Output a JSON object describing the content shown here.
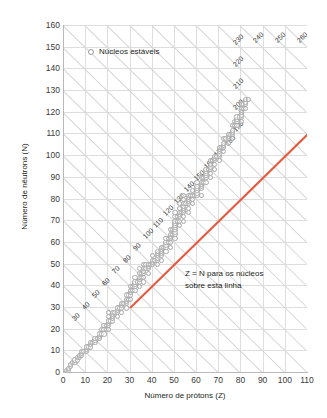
{
  "chart_data": {
    "type": "scatter",
    "title": "",
    "xlabel": "Número de prótons (Z)",
    "ylabel": "Número de nêutrons (N)",
    "xlim": [
      0,
      110
    ],
    "ylim": [
      0,
      160
    ],
    "xticks": [
      0,
      10,
      20,
      30,
      40,
      50,
      60,
      70,
      80,
      90,
      100,
      110
    ],
    "yticks": [
      0,
      10,
      20,
      30,
      40,
      50,
      60,
      70,
      80,
      90,
      100,
      110,
      120,
      130,
      140,
      150,
      160
    ],
    "xtick_step": 10,
    "ytick_step": 10,
    "grid": true,
    "legend_position": "top-left",
    "series": [
      {
        "name": "Núcleos estáveis",
        "type": "scatter",
        "marker": "open-circle",
        "color": "#a8a8a8",
        "points": [
          [
            1,
            0
          ],
          [
            1,
            1
          ],
          [
            2,
            1
          ],
          [
            2,
            2
          ],
          [
            3,
            3
          ],
          [
            3,
            4
          ],
          [
            4,
            5
          ],
          [
            5,
            5
          ],
          [
            5,
            6
          ],
          [
            6,
            6
          ],
          [
            6,
            7
          ],
          [
            7,
            7
          ],
          [
            7,
            8
          ],
          [
            8,
            8
          ],
          [
            8,
            9
          ],
          [
            8,
            10
          ],
          [
            9,
            10
          ],
          [
            10,
            10
          ],
          [
            10,
            11
          ],
          [
            10,
            12
          ],
          [
            11,
            12
          ],
          [
            12,
            12
          ],
          [
            12,
            13
          ],
          [
            12,
            14
          ],
          [
            13,
            14
          ],
          [
            14,
            14
          ],
          [
            14,
            15
          ],
          [
            14,
            16
          ],
          [
            15,
            16
          ],
          [
            16,
            16
          ],
          [
            16,
            17
          ],
          [
            16,
            18
          ],
          [
            17,
            18
          ],
          [
            17,
            20
          ],
          [
            18,
            18
          ],
          [
            18,
            20
          ],
          [
            18,
            22
          ],
          [
            19,
            20
          ],
          [
            19,
            22
          ],
          [
            20,
            20
          ],
          [
            20,
            22
          ],
          [
            20,
            23
          ],
          [
            20,
            24
          ],
          [
            20,
            26
          ],
          [
            20,
            28
          ],
          [
            21,
            24
          ],
          [
            22,
            24
          ],
          [
            22,
            25
          ],
          [
            22,
            26
          ],
          [
            22,
            27
          ],
          [
            22,
            28
          ],
          [
            23,
            28
          ],
          [
            24,
            26
          ],
          [
            24,
            28
          ],
          [
            24,
            29
          ],
          [
            24,
            30
          ],
          [
            25,
            30
          ],
          [
            26,
            28
          ],
          [
            26,
            30
          ],
          [
            26,
            31
          ],
          [
            26,
            32
          ],
          [
            27,
            32
          ],
          [
            28,
            30
          ],
          [
            28,
            32
          ],
          [
            28,
            33
          ],
          [
            28,
            34
          ],
          [
            28,
            36
          ],
          [
            29,
            34
          ],
          [
            29,
            36
          ],
          [
            30,
            34
          ],
          [
            30,
            36
          ],
          [
            30,
            37
          ],
          [
            30,
            38
          ],
          [
            30,
            40
          ],
          [
            31,
            38
          ],
          [
            31,
            40
          ],
          [
            32,
            38
          ],
          [
            32,
            40
          ],
          [
            32,
            41
          ],
          [
            32,
            42
          ],
          [
            32,
            44
          ],
          [
            33,
            42
          ],
          [
            34,
            40
          ],
          [
            34,
            42
          ],
          [
            34,
            43
          ],
          [
            34,
            44
          ],
          [
            34,
            46
          ],
          [
            34,
            48
          ],
          [
            35,
            44
          ],
          [
            35,
            46
          ],
          [
            36,
            42
          ],
          [
            36,
            44
          ],
          [
            36,
            46
          ],
          [
            36,
            47
          ],
          [
            36,
            48
          ],
          [
            36,
            50
          ],
          [
            37,
            48
          ],
          [
            37,
            50
          ],
          [
            38,
            46
          ],
          [
            38,
            48
          ],
          [
            38,
            49
          ],
          [
            38,
            50
          ],
          [
            39,
            50
          ],
          [
            40,
            50
          ],
          [
            40,
            51
          ],
          [
            40,
            52
          ],
          [
            40,
            54
          ],
          [
            41,
            52
          ],
          [
            42,
            50
          ],
          [
            42,
            52
          ],
          [
            42,
            53
          ],
          [
            42,
            54
          ],
          [
            42,
            55
          ],
          [
            42,
            56
          ],
          [
            44,
            52
          ],
          [
            44,
            54
          ],
          [
            44,
            55
          ],
          [
            44,
            56
          ],
          [
            44,
            57
          ],
          [
            44,
            58
          ],
          [
            45,
            58
          ],
          [
            46,
            56
          ],
          [
            46,
            58
          ],
          [
            46,
            59
          ],
          [
            46,
            60
          ],
          [
            46,
            62
          ],
          [
            47,
            60
          ],
          [
            47,
            62
          ],
          [
            48,
            58
          ],
          [
            48,
            60
          ],
          [
            48,
            62
          ],
          [
            48,
            63
          ],
          [
            48,
            64
          ],
          [
            48,
            66
          ],
          [
            49,
            64
          ],
          [
            49,
            66
          ],
          [
            50,
            62
          ],
          [
            50,
            64
          ],
          [
            50,
            65
          ],
          [
            50,
            66
          ],
          [
            50,
            67
          ],
          [
            50,
            68
          ],
          [
            50,
            69
          ],
          [
            50,
            70
          ],
          [
            50,
            72
          ],
          [
            50,
            74
          ],
          [
            51,
            70
          ],
          [
            51,
            72
          ],
          [
            52,
            68
          ],
          [
            52,
            70
          ],
          [
            52,
            72
          ],
          [
            52,
            73
          ],
          [
            52,
            74
          ],
          [
            52,
            76
          ],
          [
            52,
            78
          ],
          [
            53,
            74
          ],
          [
            54,
            70
          ],
          [
            54,
            72
          ],
          [
            54,
            74
          ],
          [
            54,
            75
          ],
          [
            54,
            76
          ],
          [
            54,
            77
          ],
          [
            54,
            78
          ],
          [
            54,
            80
          ],
          [
            54,
            82
          ],
          [
            55,
            78
          ],
          [
            56,
            74
          ],
          [
            56,
            76
          ],
          [
            56,
            78
          ],
          [
            56,
            79
          ],
          [
            56,
            80
          ],
          [
            56,
            81
          ],
          [
            56,
            82
          ],
          [
            57,
            82
          ],
          [
            58,
            78
          ],
          [
            58,
            80
          ],
          [
            58,
            82
          ],
          [
            58,
            84
          ],
          [
            59,
            82
          ],
          [
            60,
            82
          ],
          [
            60,
            83
          ],
          [
            60,
            84
          ],
          [
            60,
            85
          ],
          [
            60,
            86
          ],
          [
            60,
            88
          ],
          [
            62,
            82
          ],
          [
            62,
            85
          ],
          [
            62,
            86
          ],
          [
            62,
            87
          ],
          [
            62,
            88
          ],
          [
            62,
            90
          ],
          [
            63,
            88
          ],
          [
            63,
            90
          ],
          [
            64,
            88
          ],
          [
            64,
            90
          ],
          [
            64,
            91
          ],
          [
            64,
            92
          ],
          [
            64,
            93
          ],
          [
            64,
            94
          ],
          [
            65,
            94
          ],
          [
            66,
            90
          ],
          [
            66,
            92
          ],
          [
            66,
            94
          ],
          [
            66,
            95
          ],
          [
            66,
            96
          ],
          [
            66,
            98
          ],
          [
            67,
            98
          ],
          [
            68,
            94
          ],
          [
            68,
            96
          ],
          [
            68,
            98
          ],
          [
            68,
            99
          ],
          [
            68,
            100
          ],
          [
            69,
            100
          ],
          [
            70,
            98
          ],
          [
            70,
            100
          ],
          [
            70,
            101
          ],
          [
            70,
            102
          ],
          [
            70,
            103
          ],
          [
            70,
            104
          ],
          [
            71,
            104
          ],
          [
            72,
            102
          ],
          [
            72,
            104
          ],
          [
            72,
            105
          ],
          [
            72,
            106
          ],
          [
            72,
            108
          ],
          [
            73,
            108
          ],
          [
            74,
            106
          ],
          [
            74,
            108
          ],
          [
            74,
            109
          ],
          [
            74,
            110
          ],
          [
            75,
            110
          ],
          [
            76,
            108
          ],
          [
            76,
            110
          ],
          [
            76,
            111
          ],
          [
            76,
            112
          ],
          [
            76,
            114
          ],
          [
            77,
            114
          ],
          [
            77,
            116
          ],
          [
            78,
            114
          ],
          [
            78,
            116
          ],
          [
            78,
            117
          ],
          [
            78,
            118
          ],
          [
            79,
            118
          ],
          [
            80,
            116
          ],
          [
            80,
            118
          ],
          [
            80,
            119
          ],
          [
            80,
            120
          ],
          [
            80,
            121
          ],
          [
            80,
            122
          ],
          [
            80,
            124
          ],
          [
            81,
            122
          ],
          [
            81,
            124
          ],
          [
            82,
            122
          ],
          [
            82,
            124
          ],
          [
            82,
            125
          ],
          [
            82,
            126
          ],
          [
            83,
            126
          ]
        ]
      }
    ],
    "reference_line": {
      "name": "Z = N",
      "color": "#e8573c",
      "from": [
        30,
        30
      ],
      "to": [
        110,
        110
      ],
      "annotation": "Z = N para os núcleos sobre esta linha"
    },
    "mass_lines": {
      "description": "Diagonais de massa constante A = Z + N",
      "labels": [
        10,
        20,
        30,
        40,
        50,
        60,
        70,
        80,
        90,
        100,
        110,
        120,
        130,
        140,
        150,
        160,
        170,
        180,
        190,
        200,
        210,
        220,
        230,
        240,
        250,
        260
      ],
      "step": 10
    }
  },
  "legend": {
    "items": [
      {
        "label": "Núcleos estáveis",
        "marker": "open-circle"
      }
    ]
  },
  "annotation": {
    "line1": "Z = N para os núcleos",
    "line2": "sobre esta linha"
  }
}
